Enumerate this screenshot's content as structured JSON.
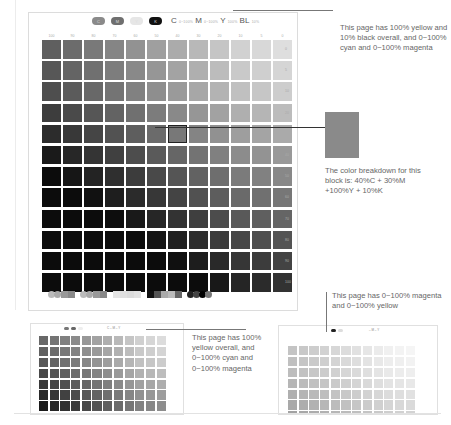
{
  "main_page": {
    "toolbar_pills": [
      {
        "name": "cyan-pill",
        "color": "#8a8a8a",
        "label": "C"
      },
      {
        "name": "magenta-pill",
        "color": "#6f6f6f",
        "label": "M"
      },
      {
        "name": "yellow-pill",
        "color": "#e6e6e6",
        "label": "Y"
      },
      {
        "name": "black-pill",
        "color": "#111111",
        "label": "K"
      }
    ],
    "formula": {
      "c": "C",
      "c_range": "0~100%",
      "m": "M",
      "m_range": "0~100%",
      "y": "Y",
      "y_value": "100%",
      "bl": "BL",
      "bl_value": "10%"
    },
    "column_labels": [
      "100",
      "90",
      "80",
      "70",
      "60",
      "50",
      "40",
      "30",
      "20",
      "10",
      "5",
      "0"
    ],
    "row_labels": [
      "0",
      "5",
      "10",
      "20",
      "30",
      "40",
      "50",
      "60",
      "70",
      "80",
      "90",
      "100"
    ],
    "selected_cell": {
      "row": 4,
      "col": 6
    }
  },
  "notes": {
    "top": "This page has 100% yellow and 10% black overall, and 0~100% cyan and 0~100% magenta",
    "callout": "The color breakdown for this block is: 40%C + 30%M +100%Y + 10%K",
    "bottom_left": "This page has 100% yellow overall, and 0~100% cyan and 0~100% magenta",
    "bottom_right": "This page has 0~100% magenta and 0~100% yellow"
  },
  "thumbnails": {
    "left": {
      "formula": "C – M – Y"
    },
    "right": {
      "formula": "– M – Y"
    }
  },
  "colors": {
    "callout_swatch": "#8a8a8a",
    "leader_line": "#333333",
    "frame": "#dcdcdc"
  }
}
